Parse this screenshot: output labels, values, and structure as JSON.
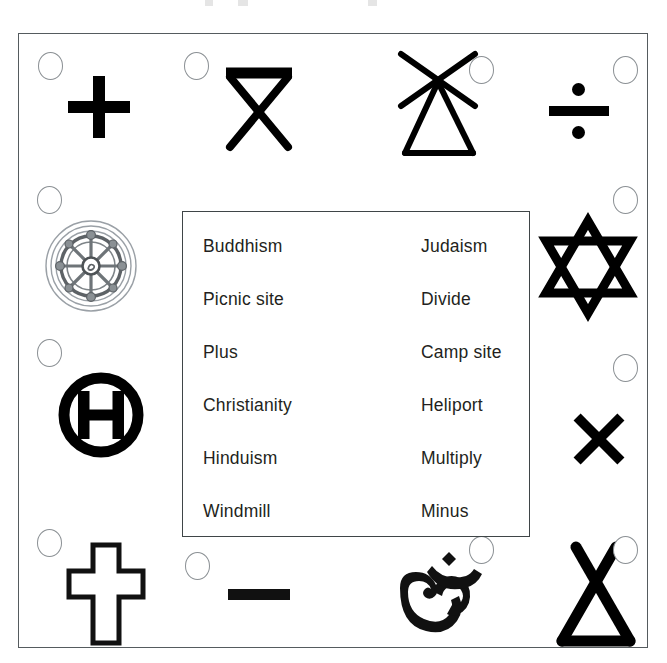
{
  "worksheet": {
    "title": "Symbol matching worksheet",
    "word_bank": {
      "columns": [
        [
          "Buddhism",
          "Picnic site",
          "Plus",
          "Christianity",
          "Hinduism",
          "Windmill"
        ],
        [
          "Judaism",
          "Divide",
          "Camp site",
          "Heliport",
          "Multiply",
          "Minus"
        ]
      ],
      "items": [
        "Buddhism",
        "Judaism",
        "Picnic site",
        "Divide",
        "Plus",
        "Camp site",
        "Christianity",
        "Heliport",
        "Hinduism",
        "Multiply",
        "Windmill",
        "Minus"
      ]
    },
    "symbols": [
      {
        "id": "plus",
        "name": "plus-symbol",
        "answer": "Plus",
        "bubble": "top-left"
      },
      {
        "id": "picnic",
        "name": "picnic-site-symbol",
        "answer": "Picnic site",
        "bubble": "top-left"
      },
      {
        "id": "windmill",
        "name": "windmill-symbol",
        "answer": "Windmill",
        "bubble": "top-right"
      },
      {
        "id": "divide",
        "name": "divide-symbol",
        "answer": "Divide",
        "bubble": "top-right"
      },
      {
        "id": "buddhism",
        "name": "dharma-wheel-symbol",
        "answer": "Buddhism",
        "bubble": "top-left"
      },
      {
        "id": "judaism",
        "name": "star-of-david-symbol",
        "answer": "Judaism",
        "bubble": "top-right"
      },
      {
        "id": "heliport",
        "name": "heliport-symbol",
        "answer": "Heliport",
        "bubble": "top-left"
      },
      {
        "id": "multiply",
        "name": "multiply-symbol",
        "answer": "Multiply",
        "bubble": "top-right"
      },
      {
        "id": "christianity",
        "name": "christian-cross-symbol",
        "answer": "Christianity",
        "bubble": "top-left"
      },
      {
        "id": "minus",
        "name": "minus-symbol",
        "answer": "Minus",
        "bubble": "top-left"
      },
      {
        "id": "hinduism",
        "name": "om-symbol",
        "answer": "Hinduism",
        "bubble": "top-right"
      },
      {
        "id": "campsite",
        "name": "camp-site-tent-symbol",
        "answer": "Camp site",
        "bubble": "top-right"
      }
    ],
    "colors": {
      "ink": "#000000",
      "text": "#231f20",
      "frame": "#555b5e",
      "box_border": "#3f4547",
      "bubble_border": "#8b9094",
      "wheel_gray": "#9aa0a6",
      "background": "#ffffff"
    }
  }
}
